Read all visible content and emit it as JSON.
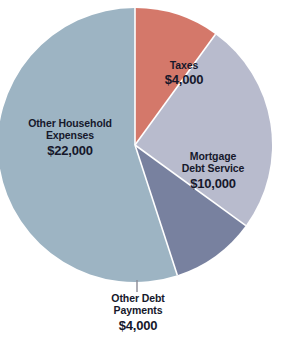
{
  "chart_data": {
    "type": "pie",
    "title": "",
    "subtitle": "",
    "xlabel": "",
    "ylabel": "",
    "legend_position": "none",
    "grid": false,
    "total": 40000,
    "currency": "$",
    "categories": [
      "Taxes",
      "Mortgage Debt Service",
      "Other Debt Payments",
      "Other Household Expenses"
    ],
    "values": [
      4000,
      10000,
      4000,
      22000
    ],
    "value_labels": [
      "$4,000",
      "$10,000",
      "$4,000",
      "$22,000"
    ],
    "percentages": [
      10,
      25,
      10,
      55
    ],
    "colors": [
      "#d4786a",
      "#b8bbcd",
      "#78819f",
      "#9db4c3"
    ],
    "slices": [
      {
        "name": "taxes",
        "label_line1": "Taxes",
        "label_line2": "",
        "value_label": "$4,000",
        "value": 4000,
        "percent": 10,
        "color": "#d4786a",
        "start_angle_deg": 0,
        "end_angle_deg": 36,
        "label_placement": "inside"
      },
      {
        "name": "mortgage-debt-service",
        "label_line1": "Mortgage",
        "label_line2": "Debt Service",
        "value_label": "$10,000",
        "value": 10000,
        "percent": 25,
        "color": "#b8bbcd",
        "start_angle_deg": 36,
        "end_angle_deg": 126,
        "label_placement": "inside"
      },
      {
        "name": "other-debt-payments",
        "label_line1": "Other Debt",
        "label_line2": "Payments",
        "value_label": "$4,000",
        "value": 4000,
        "percent": 10,
        "color": "#78819f",
        "start_angle_deg": 126,
        "end_angle_deg": 162,
        "label_placement": "outside-bottom-with-leader"
      },
      {
        "name": "other-household-expenses",
        "label_line1": "Other Household",
        "label_line2": "Expenses",
        "value_label": "$22,000",
        "value": 22000,
        "percent": 55,
        "color": "#9db4c3",
        "start_angle_deg": 162,
        "end_angle_deg": 360,
        "label_placement": "inside"
      }
    ],
    "geometry": {
      "center_x": 135,
      "center_y": 145,
      "radius": 137,
      "separator_color": "#ffffff",
      "separator_width": 1.6,
      "leader_line_color": "#8b8b96",
      "leader_x": 137,
      "leader_y_start": 280,
      "leader_y_end": 292
    },
    "text_color": "#16182b",
    "background": "#ffffff"
  }
}
